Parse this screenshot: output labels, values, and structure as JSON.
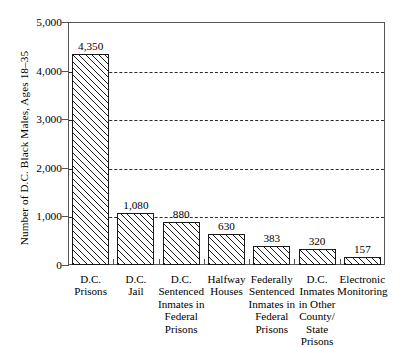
{
  "chart_data": {
    "type": "bar",
    "title": "",
    "xlabel": "",
    "ylabel": "Number of D.C. Black Males, Ages 18–35",
    "ylim": [
      0,
      5000
    ],
    "yticks": [
      "0",
      "1,000",
      "2,000",
      "3,000",
      "4,000",
      "5,000"
    ],
    "ytick_values": [
      0,
      1000,
      2000,
      3000,
      4000,
      5000
    ],
    "gridlines_at": [
      1000,
      2000,
      3000,
      4000
    ],
    "grid": "horizontal-dashed",
    "legend": "none",
    "categories": [
      "D.C.\nPrisons",
      "D.C.\nJail",
      "D.C.\nSentenced\nInmates in\nFederal\nPrisons",
      "Halfway\nHouses",
      "Federally\nSentenced\nInmates in\nFederal\nPrisons",
      "D.C.\nInmates\nin Other\nCounty/\nState\nPrisons",
      "Electronic\nMonitoring"
    ],
    "values": [
      4350,
      1080,
      880,
      630,
      383,
      320,
      157
    ],
    "value_labels": [
      "4,350",
      "1,080",
      "880",
      "630",
      "383",
      "320",
      "157"
    ],
    "bar_fill": "diagonal-hatch",
    "bar_outline_color": "#1a1a1a",
    "axis_color": "#555555",
    "background_color": "#ffffff"
  }
}
